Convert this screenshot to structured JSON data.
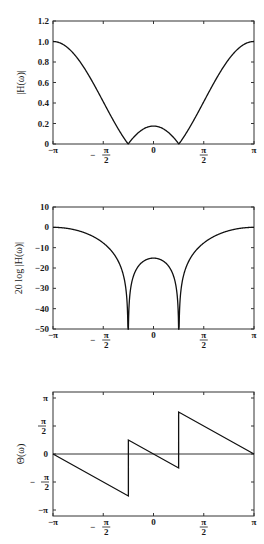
{
  "chart_data": [
    {
      "type": "line",
      "title": "",
      "xlabel": "",
      "ylabel": "|H(ω)|",
      "xlim": [
        "-π",
        "π"
      ],
      "ylim": [
        0,
        1.2
      ],
      "x_ticks": [
        "-π",
        "-π/2",
        "0",
        "π/2",
        "π"
      ],
      "y_ticks": [
        "0",
        "0.2",
        "0.4",
        "0.6",
        "0.8",
        "1.0",
        "1.2"
      ],
      "grid": false,
      "series": [
        {
          "name": "|H(ω)|",
          "x": [
            "-π",
            "-3π/4",
            "-π/2",
            "-π/4",
            "0",
            "π/4",
            "π/2",
            "3π/4",
            "π"
          ],
          "values": [
            1.0,
            0.82,
            0.41,
            0.0,
            0.17,
            0.0,
            0.41,
            0.82,
            1.0
          ]
        }
      ],
      "annotations": "zeros at ω ≈ ±π/4; local max ≈0.17 at ω=0"
    },
    {
      "type": "line",
      "title": "",
      "xlabel": "",
      "ylabel": "20 log |H(ω)|",
      "xlim": [
        "-π",
        "π"
      ],
      "ylim": [
        -50,
        10
      ],
      "x_ticks": [
        "-π",
        "-π/2",
        "0",
        "π/2",
        "π"
      ],
      "y_ticks": [
        "-50",
        "-40",
        "-30",
        "-20",
        "-10",
        "0",
        "10"
      ],
      "grid": false,
      "series": [
        {
          "name": "20 log |H(ω)|",
          "x": [
            "-π",
            "-3π/4",
            "-π/2",
            "-π/4",
            "0",
            "π/4",
            "π/2",
            "3π/4",
            "π"
          ],
          "values": [
            0,
            -1.7,
            -7.7,
            -50,
            -15.4,
            -50,
            -7.7,
            -1.7,
            0
          ]
        }
      ],
      "annotations": "nulls (→ -∞, clipped at -50 dB) at ω ≈ ±π/4"
    },
    {
      "type": "line",
      "title": "",
      "xlabel": "",
      "ylabel": "Θ(ω)",
      "xlim": [
        "-π",
        "π"
      ],
      "ylim": [
        "-π",
        "π"
      ],
      "x_ticks": [
        "-π",
        "-π/2",
        "0",
        "π/2",
        "π"
      ],
      "y_ticks": [
        "-π",
        "-π/2",
        "0",
        "π/2",
        "π"
      ],
      "grid": false,
      "zero_line": true,
      "series": [
        {
          "name": "Θ(ω)",
          "x": [
            "-π",
            "-π/4",
            "-π/4",
            "π/4",
            "π/4",
            "π"
          ],
          "values": [
            "0",
            "-3π/4",
            "π/4",
            "-π/4",
            "3π/4",
            "0"
          ]
        }
      ],
      "annotations": "linear phase slope -1 with +π jumps at ω = ±π/4"
    }
  ],
  "labels": {
    "p1_ylabel": "|H(ω)|",
    "p2_ylabel": "20 log |H(ω)|",
    "p3_ylabel": "Θ(ω)"
  }
}
